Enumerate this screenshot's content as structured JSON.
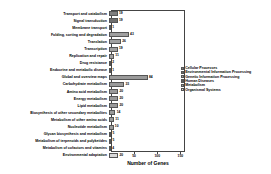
{
  "chart_data": {
    "type": "bar",
    "orientation": "horizontal",
    "title": "",
    "xlabel": "Number of Genes",
    "ylabel": "",
    "xlim": [
      0,
      160
    ],
    "xticks": [
      50,
      100,
      150
    ],
    "xtick_labels": [
      "50",
      "100",
      "150"
    ],
    "grid": false,
    "legend_position": "right",
    "categories": [
      "Transport and catabolism",
      "Signal transduction",
      "Membrane transport",
      "Folding, sorting and degradation",
      "Translation",
      "Transcription",
      "Replication and repair",
      "Drug resistance",
      "Endocrine and metabolic disease",
      "Global and overview maps",
      "Carbohydrate metabolism",
      "Amino acid metabolism",
      "Energy metabolism",
      "Lipid metabolism",
      "Biosynthesis of other secondary metabolites",
      "Metabolism of other amino acids",
      "Nucleotide metabolism",
      "Glycan biosynthesis and metabolism",
      "Metabolism of terpenoids and polyketides",
      "Metabolism of cofactors and vitamins",
      "Environmental adaptation"
    ],
    "values": [
      19,
      19,
      1,
      43,
      26,
      19,
      11,
      2,
      1,
      84,
      33,
      20,
      20,
      20,
      14,
      11,
      10,
      5,
      5,
      4,
      20
    ],
    "value_labels": [
      "19",
      "19",
      "1",
      "43",
      "26",
      "19",
      "11",
      "2",
      "1",
      "84",
      "33",
      "20",
      "20",
      "20",
      "14",
      "11",
      "10",
      "5",
      "5",
      "4",
      "20"
    ],
    "group_of_bar": [
      "Cellular Processes",
      "Environmental Information Processing",
      "Environmental Information Processing",
      "Genetic Information Processing",
      "Genetic Information Processing",
      "Genetic Information Processing",
      "Genetic Information Processing",
      "Human Diseases",
      "Human Diseases",
      "Metabolism",
      "Metabolism",
      "Metabolism",
      "Metabolism",
      "Metabolism",
      "Metabolism",
      "Metabolism",
      "Metabolism",
      "Metabolism",
      "Metabolism",
      "Metabolism",
      "Organismal Systems"
    ],
    "series": [
      {
        "name": "Cellular Processes",
        "color": "#7f7f7f"
      },
      {
        "name": "Environmental Information Processing",
        "color": "#6e6e6e"
      },
      {
        "name": "Genetic Information Processing",
        "color": "#a0a0a0"
      },
      {
        "name": "Human Diseases",
        "color": "#5c5c5c"
      },
      {
        "name": "Metabolism",
        "color": "#9a9a9a"
      },
      {
        "name": "Organismal Systems",
        "color": "#d9d9d9"
      }
    ]
  },
  "legend": {
    "entries": [
      {
        "label": "Cellular Processes",
        "color": "#7f7f7f"
      },
      {
        "label": "Environmental Information Processing",
        "color": "#6e6e6e"
      },
      {
        "label": "Genetic Information Processing",
        "color": "#a0a0a0"
      },
      {
        "label": "Human Diseases",
        "color": "#5c5c5c"
      },
      {
        "label": "Metabolism",
        "color": "#9a9a9a"
      },
      {
        "label": "Organismal Systems",
        "color": "#d9d9d9"
      }
    ]
  },
  "axis": {
    "xlabel": "Number of Genes"
  }
}
